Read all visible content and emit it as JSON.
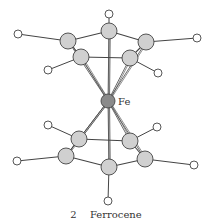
{
  "figure": {
    "number": "2",
    "title": "Ferrocene",
    "metal_label": "Fe"
  },
  "colors": {
    "carbon": "#d0d0d0",
    "iron": "#8a8a8a",
    "hydrogen": "#ffffff",
    "stroke": "#444444"
  },
  "molecule": {
    "iron": {
      "x": 108,
      "y": 101,
      "r": 7
    },
    "top_ring": [
      {
        "id": "t1",
        "x": 109,
        "y": 31
      },
      {
        "id": "t2",
        "x": 146,
        "y": 42
      },
      {
        "id": "t3",
        "x": 130,
        "y": 58
      },
      {
        "id": "t4",
        "x": 81,
        "y": 57
      },
      {
        "id": "t5",
        "x": 68,
        "y": 41
      }
    ],
    "top_h": [
      {
        "x": 109,
        "y": 14
      },
      {
        "x": 197,
        "y": 38
      },
      {
        "x": 158,
        "y": 73
      },
      {
        "x": 48,
        "y": 70
      },
      {
        "x": 18,
        "y": 34
      }
    ],
    "bottom_ring": [
      {
        "id": "b1",
        "x": 109,
        "y": 167
      },
      {
        "id": "b2",
        "x": 145,
        "y": 159
      },
      {
        "id": "b3",
        "x": 130,
        "y": 141
      },
      {
        "id": "b4",
        "x": 79,
        "y": 139
      },
      {
        "id": "b5",
        "x": 66,
        "y": 156
      }
    ],
    "bottom_h": [
      {
        "x": 108,
        "y": 201
      },
      {
        "x": 194,
        "y": 165
      },
      {
        "x": 157,
        "y": 127
      },
      {
        "x": 48,
        "y": 125
      },
      {
        "x": 17,
        "y": 161
      }
    ]
  }
}
